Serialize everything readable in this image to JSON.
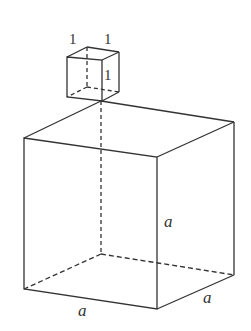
{
  "figure": {
    "small_cube": {
      "labels": [
        "1",
        "1",
        "1"
      ]
    },
    "large_cube": {
      "labels": [
        "a",
        "a",
        "a"
      ]
    },
    "colors": {
      "line": "#333333",
      "background": "#ffffff"
    }
  }
}
